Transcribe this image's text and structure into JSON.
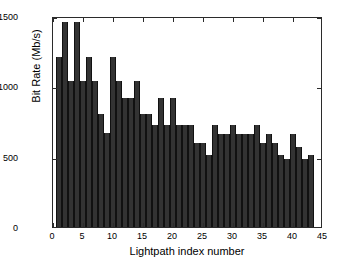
{
  "chart_data": {
    "type": "bar",
    "title": "",
    "xlabel": "Lightpath index number",
    "ylabel": "Bit Rate (Mb/s)",
    "xlim": [
      0,
      45
    ],
    "ylim": [
      0,
      1500
    ],
    "xticks": [
      0,
      5,
      10,
      15,
      20,
      25,
      30,
      35,
      40,
      45
    ],
    "yticks": [
      0,
      500,
      1000,
      1500
    ],
    "grid": false,
    "legend": null,
    "bar_color": "#333333",
    "axis_color": "#2b2b2b",
    "background": "#ffffff",
    "categories": [
      1,
      2,
      3,
      4,
      5,
      6,
      7,
      8,
      9,
      10,
      11,
      12,
      13,
      14,
      15,
      16,
      17,
      18,
      19,
      20,
      21,
      22,
      23,
      24,
      25,
      26,
      27,
      28,
      29,
      30,
      31,
      32,
      33,
      34,
      35,
      36,
      37,
      38,
      39,
      40,
      41,
      42,
      43
    ],
    "values": [
      1210,
      1455,
      1035,
      1455,
      1035,
      1210,
      1035,
      805,
      665,
      1210,
      1035,
      915,
      915,
      1035,
      805,
      805,
      725,
      915,
      725,
      915,
      725,
      725,
      725,
      600,
      600,
      515,
      725,
      660,
      660,
      725,
      660,
      660,
      660,
      725,
      600,
      660,
      600,
      515,
      485,
      660,
      570,
      485,
      515
    ],
    "series": [
      {
        "name": "Bit Rate",
        "values": [
          1210,
          1455,
          1035,
          1455,
          1035,
          1210,
          1035,
          805,
          665,
          1210,
          1035,
          915,
          915,
          1035,
          805,
          805,
          725,
          915,
          725,
          915,
          725,
          725,
          725,
          600,
          600,
          515,
          725,
          660,
          660,
          725,
          660,
          660,
          660,
          725,
          600,
          660,
          600,
          515,
          485,
          660,
          570,
          485,
          515
        ]
      }
    ]
  },
  "figure": {
    "xtick_labels": [
      "0",
      "5",
      "10",
      "15",
      "20",
      "25",
      "30",
      "35",
      "40",
      "45"
    ],
    "ytick_labels": [
      "0",
      "500",
      "1000",
      "1500"
    ]
  }
}
